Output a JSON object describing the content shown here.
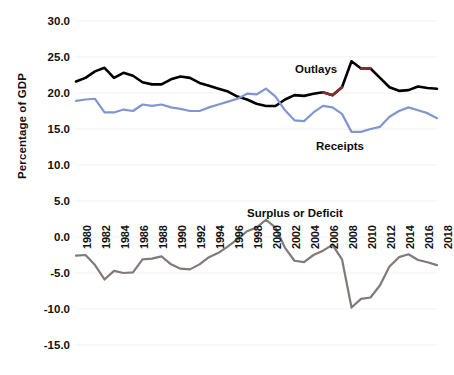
{
  "chart_data": {
    "type": "line",
    "title": "",
    "xlabel": "",
    "ylabel": "Percentage of GDP",
    "ylim": [
      -15.0,
      30.0
    ],
    "xlim": [
      1980,
      2018
    ],
    "grid": true,
    "legend_position": "inline-annotations",
    "ytick_labels": [
      "30.0",
      "25.0",
      "20.0",
      "15.0",
      "10.0",
      "5.0",
      "0.0",
      "-5.0",
      "-10.0",
      "-15.0"
    ],
    "ytick_values": [
      30.0,
      25.0,
      20.0,
      15.0,
      10.0,
      5.0,
      0.0,
      -5.0,
      -10.0,
      -15.0
    ],
    "xtick_labels": [
      "1980",
      "1982",
      "1984",
      "1986",
      "1988",
      "1990",
      "1992",
      "1994",
      "1996",
      "1998",
      "2000",
      "2002",
      "2004",
      "2006",
      "2008",
      "2010",
      "2012",
      "2014",
      "2016",
      "2018"
    ],
    "xtick_values": [
      1980,
      1982,
      1984,
      1986,
      1988,
      1990,
      1992,
      1994,
      1996,
      1998,
      2000,
      2002,
      2004,
      2006,
      2008,
      2010,
      2012,
      2014,
      2016,
      2018
    ],
    "x": [
      1980,
      1981,
      1982,
      1983,
      1984,
      1985,
      1986,
      1987,
      1988,
      1989,
      1990,
      1991,
      1992,
      1993,
      1994,
      1995,
      1996,
      1997,
      1998,
      1999,
      2000,
      2001,
      2002,
      2003,
      2004,
      2005,
      2006,
      2007,
      2008,
      2009,
      2010,
      2011,
      2012,
      2013,
      2014,
      2015,
      2016,
      2017,
      2018
    ],
    "series": [
      {
        "name": "Outlays",
        "color": "#000000",
        "accent_color": "#8c2b2b",
        "values": [
          21.6,
          22.1,
          23.0,
          23.5,
          22.1,
          22.8,
          22.4,
          21.5,
          21.2,
          21.2,
          21.9,
          22.3,
          22.1,
          21.4,
          21.0,
          20.6,
          20.2,
          19.5,
          19.1,
          18.5,
          18.2,
          18.2,
          19.1,
          19.7,
          19.6,
          19.9,
          20.1,
          19.7,
          20.8,
          24.4,
          23.4,
          23.4,
          22.1,
          20.8,
          20.3,
          20.4,
          20.9,
          20.7,
          20.6
        ]
      },
      {
        "name": "Receipts",
        "color": "#8196ce",
        "values": [
          18.9,
          19.1,
          19.2,
          17.3,
          17.3,
          17.7,
          17.5,
          18.4,
          18.2,
          18.4,
          18.0,
          17.8,
          17.5,
          17.5,
          18.0,
          18.4,
          18.8,
          19.2,
          19.9,
          19.8,
          20.6,
          19.5,
          17.6,
          16.2,
          16.1,
          17.3,
          18.2,
          18.0,
          17.1,
          14.6,
          14.6,
          15.0,
          15.3,
          16.7,
          17.5,
          18.0,
          17.6,
          17.2,
          16.5
        ]
      },
      {
        "name": "Surplus or Deficit",
        "color": "#807a78",
        "values": [
          -2.6,
          -2.5,
          -3.9,
          -5.9,
          -4.7,
          -5.0,
          -4.9,
          -3.1,
          -3.0,
          -2.7,
          -3.8,
          -4.4,
          -4.5,
          -3.8,
          -2.8,
          -2.2,
          -1.3,
          -0.3,
          0.8,
          1.3,
          2.4,
          1.3,
          -1.5,
          -3.3,
          -3.5,
          -2.5,
          -1.9,
          -1.1,
          -3.1,
          -9.8,
          -8.6,
          -8.4,
          -6.7,
          -4.1,
          -2.8,
          -2.4,
          -3.2,
          -3.5,
          -3.9
        ]
      }
    ],
    "annotations": [
      {
        "text": "Outlays",
        "x_px": 295,
        "y_px": 63
      },
      {
        "text": "Receipts",
        "x_px": 316,
        "y_px": 140
      },
      {
        "text": "Surplus or Deficit",
        "x_px": 247,
        "y_px": 207
      }
    ]
  },
  "axis": {
    "y_title": "Percentage of GDP"
  }
}
